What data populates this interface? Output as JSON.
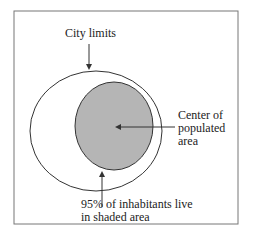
{
  "diagram": {
    "labels": {
      "city_limits": "City limits",
      "center_line1": "Center of",
      "center_line2": "populated",
      "center_line3": "area",
      "inhabitants_line1": "95% of inhabitants live",
      "inhabitants_line2": "in shaded area"
    },
    "colors": {
      "shade": "#b5b5b5",
      "stroke": "#333333",
      "frame": "#777777"
    }
  }
}
